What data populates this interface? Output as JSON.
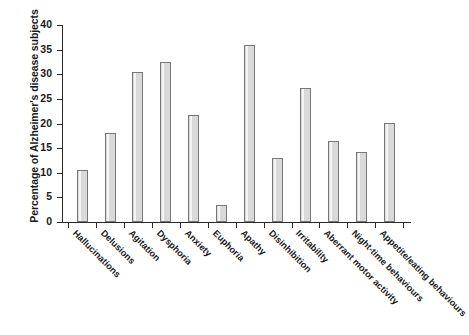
{
  "chart_data": {
    "type": "bar",
    "title": "",
    "xlabel": "",
    "ylabel": "Percentage of Alzheimer's disease subjects",
    "ylim": [
      0,
      40
    ],
    "yticks": [
      0,
      5,
      10,
      15,
      20,
      25,
      30,
      35,
      40
    ],
    "grid": false,
    "legend": null,
    "bar_fill_color": "#d9d9d9",
    "bar_edge_color": "#777777",
    "axis_color": "#2b2b2b",
    "categories": [
      "Hallucinations",
      "Delusions",
      "Agitation",
      "Dysphoria",
      "Anxiety",
      "Euphoria",
      "Apathy",
      "Disinhibition",
      "Irritability",
      "Aberrant motor activity",
      "Night-time behaviours",
      "Appetite/eating behaviours"
    ],
    "values": [
      10.5,
      18.0,
      30.5,
      32.5,
      21.7,
      3.5,
      36.0,
      13.0,
      27.3,
      16.4,
      14.2,
      20.2
    ]
  }
}
